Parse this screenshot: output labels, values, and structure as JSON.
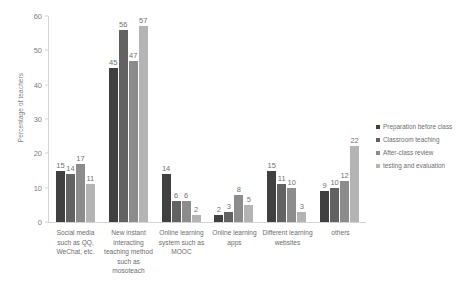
{
  "chart_data": {
    "type": "bar",
    "title": "",
    "xlabel": "",
    "ylabel": "Percentage of teachers",
    "ylim": [
      0,
      60
    ],
    "yticks": [
      0,
      10,
      20,
      30,
      40,
      50,
      60
    ],
    "grid": false,
    "legend_position": "right",
    "categories": [
      "Social media such as QQ, WeChat, etc.",
      "New instant interacting teaching method such as mosoteach",
      "Online learning system such as MOOC",
      "Online learning apps",
      "Different learning websites",
      "others"
    ],
    "series": [
      {
        "name": "Preparation before class",
        "color": "#404040",
        "values": [
          15,
          45,
          14,
          2,
          15,
          9
        ]
      },
      {
        "name": "Classroom teaching",
        "color": "#626262",
        "values": [
          14,
          56,
          6,
          3,
          11,
          10
        ]
      },
      {
        "name": "After-class review",
        "color": "#8c8c8c",
        "values": [
          17,
          47,
          6,
          8,
          10,
          12
        ]
      },
      {
        "name": "testing and evaluation",
        "color": "#b4b4b4",
        "values": [
          11,
          57,
          2,
          5,
          3,
          22
        ]
      }
    ]
  }
}
